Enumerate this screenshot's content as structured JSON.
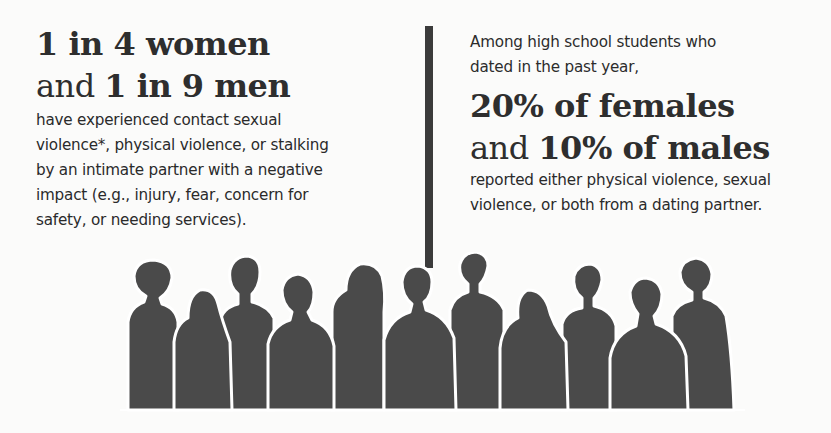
{
  "left_stat": {
    "line1_strong": "1 in 4 women",
    "line2_light": "and ",
    "line2_strong": "1 in 9 men",
    "description_lines": [
      "have experienced contact sexual",
      "violence*, physical violence, or stalking",
      "by an intimate partner with a negative",
      "impact (e.g., injury, fear, concern for",
      "safety, or needing services)."
    ]
  },
  "right_stat": {
    "lead_lines": [
      "Among high school students who",
      "dated in the past year,"
    ],
    "line1_strong": "20% of females",
    "line2_light": "and ",
    "line2_strong": "10% of males",
    "description_lines": [
      "reported either physical violence, sexual",
      "violence, or both from a dating partner."
    ]
  },
  "illustration": {
    "type": "crowd-silhouettes",
    "figure_count": 12,
    "fill_color": "#4a4a4a",
    "outline_color": "#ffffff"
  },
  "colors": {
    "background": "#fbfbfa",
    "text": "#2c2c2c",
    "divider": "#3b3b3b"
  }
}
